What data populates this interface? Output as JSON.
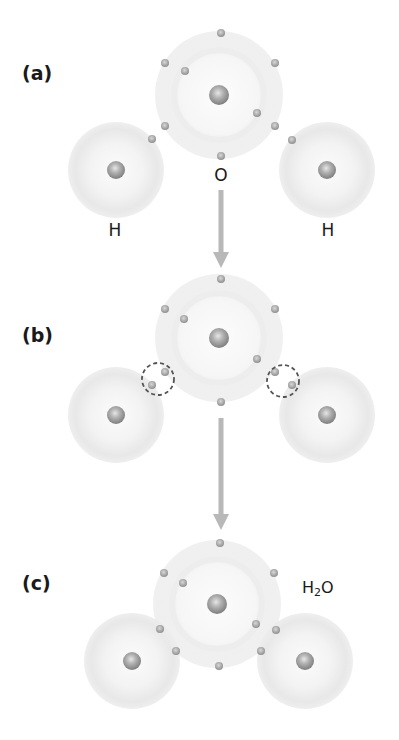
{
  "figure": {
    "colors": {
      "atom_shell": "#ececec",
      "atom_glow": "#f7f7f7",
      "nucleus": "#9a9a9a",
      "electron": "#a8a8a8",
      "arrow": "#b8b8b8",
      "dashed_ring": "#555555",
      "text": "#1a1a1a"
    },
    "panels": [
      {
        "id": "a",
        "label": "(a)",
        "label_pos": [
          22,
          62
        ],
        "atoms": [
          {
            "element": "O",
            "label": "O",
            "center": [
              219,
              95
            ],
            "radius": 64,
            "label_pos": [
              221,
              165
            ],
            "electrons": [
              [
                221,
                33
              ],
              [
                165,
                63
              ],
              [
                275,
                63
              ],
              [
                185,
                71
              ],
              [
                257,
                113
              ],
              [
                165,
                126
              ],
              [
                275,
                126
              ],
              [
                221,
                156
              ]
            ]
          },
          {
            "element": "H",
            "label": "H",
            "center": [
              116,
              170
            ],
            "radius": 48,
            "label_pos": [
              115,
              220
            ],
            "electrons": [
              [
                152,
                139
              ]
            ]
          },
          {
            "element": "H",
            "label": "H",
            "center": [
              327,
              170
            ],
            "radius": 48,
            "label_pos": [
              328,
              220
            ],
            "electrons": [
              [
                292,
                140
              ]
            ]
          }
        ],
        "shared_pairs": []
      },
      {
        "id": "b",
        "label": "(b)",
        "label_pos": [
          22,
          324
        ],
        "atoms": [
          {
            "element": "O",
            "label": "",
            "center": [
              219,
              338
            ],
            "radius": 64,
            "electrons": [
              [
                221,
                279
              ],
              [
                165,
                309
              ],
              [
                275,
                309
              ],
              [
                184,
                319
              ],
              [
                257,
                359
              ],
              [
                165,
                372
              ],
              [
                275,
                372
              ],
              [
                221,
                402
              ]
            ]
          },
          {
            "element": "H",
            "label": "",
            "center": [
              116,
              415
            ],
            "radius": 48,
            "electrons": [
              [
                152,
                385
              ]
            ]
          },
          {
            "element": "H",
            "label": "",
            "center": [
              327,
              415
            ],
            "radius": 48,
            "electrons": [
              [
                292,
                385
              ]
            ]
          }
        ],
        "shared_pairs": [
          {
            "center": [
              158,
              379
            ],
            "radius": 16
          },
          {
            "center": [
              283,
              381
            ],
            "radius": 16
          }
        ]
      },
      {
        "id": "c",
        "label": "(c)",
        "label_pos": [
          22,
          572
        ],
        "formula": {
          "main": "H",
          "sub": "2",
          "tail": "O",
          "pos": [
            302,
            578
          ]
        },
        "atoms": [
          {
            "element": "O",
            "label": "",
            "center": [
              217,
              604
            ],
            "radius": 64,
            "electrons": [
              [
                220,
                543
              ],
              [
                164,
                573
              ],
              [
                274,
                573
              ],
              [
                183,
                583
              ],
              [
                256,
                624
              ],
              [
                219,
                666
              ]
            ]
          },
          {
            "element": "H",
            "label": "",
            "center": [
              132,
              661
            ],
            "radius": 48,
            "electrons": [
              [
                160,
                629
              ],
              [
                176,
                651
              ]
            ]
          },
          {
            "element": "H",
            "label": "",
            "center": [
              305,
              661
            ],
            "radius": 48,
            "electrons": [
              [
                276,
                630
              ],
              [
                261,
                651
              ]
            ]
          }
        ],
        "shared_pairs": []
      }
    ],
    "arrows": [
      {
        "x": 221,
        "y1": 190,
        "y2": 268
      },
      {
        "x": 221,
        "y1": 418,
        "y2": 530
      }
    ]
  }
}
